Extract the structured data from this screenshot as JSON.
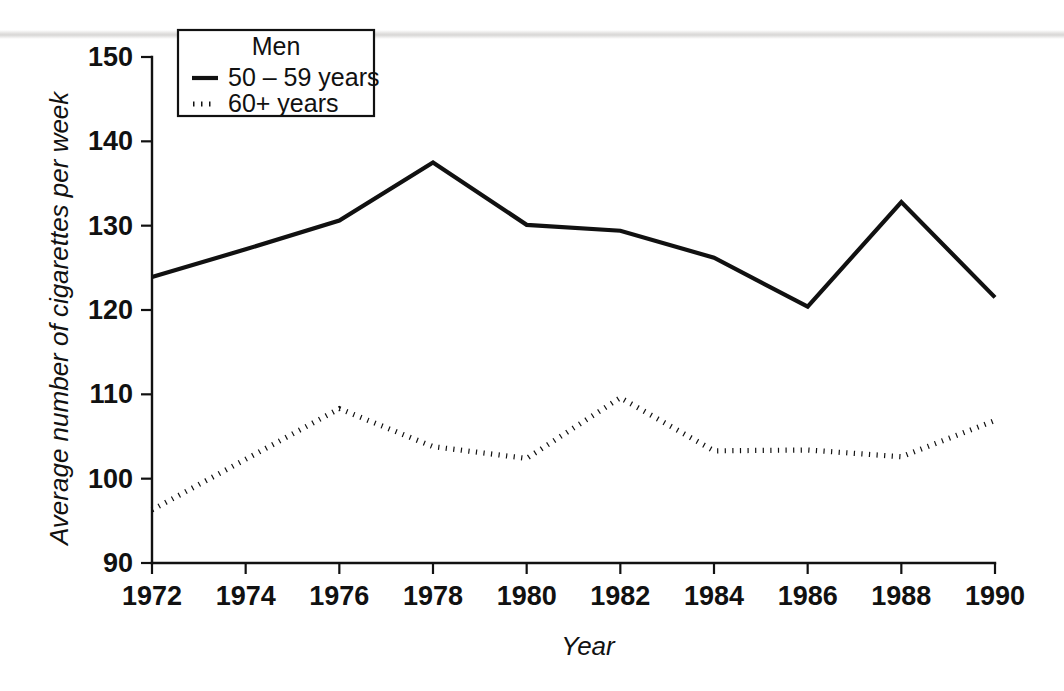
{
  "chart_data": {
    "type": "line",
    "title": "",
    "xlabel": "Year",
    "ylabel": "Average number of cigarettes per week",
    "x": [
      1972,
      1974,
      1976,
      1978,
      1980,
      1982,
      1984,
      1986,
      1988,
      1990
    ],
    "xticklabels": [
      "1972",
      "1974",
      "1976",
      "1978",
      "1980",
      "1982",
      "1984",
      "1986",
      "1988",
      "1990"
    ],
    "xlim": [
      1972,
      1990
    ],
    "ylim": [
      90,
      150
    ],
    "yticks": [
      90,
      100,
      110,
      120,
      130,
      140,
      150
    ],
    "yticklabels": [
      "90",
      "100",
      "110",
      "120",
      "130",
      "140",
      "150"
    ],
    "grid": false,
    "legend_position": "top-left-inside",
    "legend_title": "Men",
    "series": [
      {
        "name": "50 – 59 years",
        "style": "solid",
        "color": "#111111",
        "values": [
          123.9,
          127.2,
          130.6,
          137.5,
          130.1,
          129.4,
          126.2,
          120.4,
          132.8,
          121.5
        ]
      },
      {
        "name": "60+ years",
        "style": "dotted",
        "color": "#111111",
        "values": [
          96.3,
          102.3,
          108.3,
          103.8,
          102.4,
          109.6,
          103.3,
          103.4,
          102.6,
          106.9
        ]
      }
    ]
  },
  "axes": {
    "y_axis_title": "Average number of cigarettes per week",
    "x_axis_title": "Year"
  },
  "legend": {
    "title": "Men",
    "entries": [
      {
        "label": "50 – 59 years",
        "style": "solid"
      },
      {
        "label": "60+ years",
        "style": "dotted"
      }
    ]
  }
}
